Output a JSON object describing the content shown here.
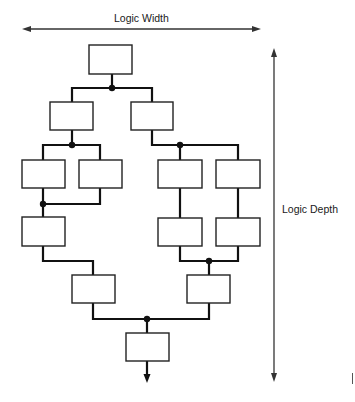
{
  "diagram": {
    "type": "logic-tree",
    "axes": {
      "width_label": "Logic Width",
      "depth_label": "Logic Depth"
    },
    "colors": {
      "line": "#111111",
      "box_border": "#222222",
      "box_fill": "#ffffff",
      "arrow": "#333333"
    },
    "boxes": [
      {
        "id": "b1",
        "x": 89,
        "y": 45,
        "w": 43,
        "h": 29
      },
      {
        "id": "b2",
        "x": 50,
        "y": 102,
        "w": 43,
        "h": 28
      },
      {
        "id": "b3",
        "x": 131,
        "y": 102,
        "w": 42,
        "h": 28
      },
      {
        "id": "b4",
        "x": 22,
        "y": 160,
        "w": 43,
        "h": 28
      },
      {
        "id": "b5",
        "x": 79,
        "y": 160,
        "w": 43,
        "h": 28
      },
      {
        "id": "b6",
        "x": 158,
        "y": 160,
        "w": 44,
        "h": 28
      },
      {
        "id": "b7",
        "x": 216,
        "y": 160,
        "w": 44,
        "h": 28
      },
      {
        "id": "b8",
        "x": 22,
        "y": 217,
        "w": 43,
        "h": 29
      },
      {
        "id": "b9",
        "x": 158,
        "y": 218,
        "w": 44,
        "h": 28
      },
      {
        "id": "b10",
        "x": 216,
        "y": 218,
        "w": 44,
        "h": 28
      },
      {
        "id": "b11",
        "x": 72,
        "y": 275,
        "w": 43,
        "h": 28
      },
      {
        "id": "b12",
        "x": 187,
        "y": 275,
        "w": 43,
        "h": 28
      },
      {
        "id": "b13",
        "x": 126,
        "y": 333,
        "w": 43,
        "h": 28
      }
    ],
    "junctions": [
      {
        "x": 112,
        "y": 88
      },
      {
        "x": 72,
        "y": 145
      },
      {
        "x": 180,
        "y": 145
      },
      {
        "x": 43,
        "y": 204
      },
      {
        "x": 209,
        "y": 261
      },
      {
        "x": 147,
        "y": 319
      }
    ],
    "wires": [
      "M112 74 L112 88",
      "M72 102 L72 88 L152 88 L152 102",
      "M72 130 L72 145",
      "M43 160 L43 145 L100 145 L100 160",
      "M152 130 L152 145 L238 145 L238 160",
      "M180 145 L180 160",
      "M43 188 L43 217",
      "M43 204 L100 204 L100 188",
      "M180 188 L180 218",
      "M238 188 L238 218",
      "M180 246 L180 261 L238 261 L238 246",
      "M209 261 L209 275",
      "M43 246 L43 261 L93 261 L93 275",
      "M93 303 L93 319 L209 319 L209 303",
      "M147 319 L147 333",
      "M147 361 L147 376"
    ],
    "width_arrow": {
      "x1": 22,
      "x2": 261,
      "y": 29
    },
    "depth_arrow": {
      "x": 274,
      "y1": 48,
      "y2": 382
    },
    "output_arrow": {
      "x": 147,
      "y_tip": 383
    }
  }
}
